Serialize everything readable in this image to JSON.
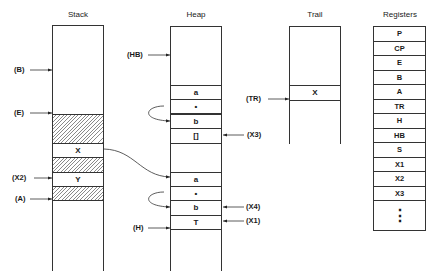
{
  "titles": {
    "stack": "Stack",
    "heap": "Heap",
    "trail": "Trail",
    "registers": "Registers"
  },
  "stack": {
    "cells": [
      {
        "label": "",
        "hatched": true,
        "top": 113,
        "height": 29
      },
      {
        "label": "X",
        "hatched": false,
        "top": 142,
        "height": 14
      },
      {
        "label": "",
        "hatched": true,
        "top": 156,
        "height": 15
      },
      {
        "label": "Y",
        "hatched": false,
        "top": 171,
        "height": 14
      },
      {
        "label": "",
        "hatched": true,
        "top": 185,
        "height": 14
      }
    ],
    "pointers": [
      {
        "label": "(B)",
        "y": 70
      },
      {
        "label": "(E)",
        "y": 113
      },
      {
        "label": "(X2)",
        "y": 178
      },
      {
        "label": "(A)",
        "y": 199
      }
    ]
  },
  "heap": {
    "cells": [
      {
        "label": "a",
        "top": 84
      },
      {
        "label": "•",
        "top": 99
      },
      {
        "label": "b",
        "top": 113
      },
      {
        "label": "[]",
        "top": 128
      },
      {
        "label": "a",
        "top": 171
      },
      {
        "label": "•",
        "top": 185
      },
      {
        "label": "b",
        "top": 199
      },
      {
        "label": "T",
        "top": 214
      }
    ],
    "left_pointers": [
      {
        "label": "(HB)",
        "y": 55
      },
      {
        "label": "(H)",
        "y": 228
      }
    ],
    "right_pointers": [
      {
        "label": "(X3)",
        "y": 135
      },
      {
        "label": "(X4)",
        "y": 207
      },
      {
        "label": "(X1)",
        "y": 221
      }
    ]
  },
  "trail": {
    "cells": [
      {
        "label": "X",
        "top": 84
      }
    ],
    "pointers": [
      {
        "label": "(TR)",
        "y": 99
      }
    ]
  },
  "registers": {
    "items": [
      "P",
      "CP",
      "E",
      "B",
      "A",
      "TR",
      "H",
      "HB",
      "S",
      "X1",
      "X2",
      "X3"
    ],
    "continuation": "⋮"
  }
}
